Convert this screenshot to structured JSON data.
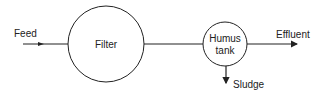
{
  "diagram": {
    "type": "process-flow",
    "nodes": [
      {
        "id": "filter",
        "label": "Filter",
        "shape": "circle"
      },
      {
        "id": "humus_tank",
        "label_line1": "Humus",
        "label_line2": "tank",
        "shape": "circle"
      }
    ],
    "streams": {
      "feed": "Feed",
      "effluent": "Effluent",
      "sludge": "Sludge"
    },
    "edges": [
      {
        "from": "Feed",
        "to": "filter"
      },
      {
        "from": "filter",
        "to": "humus_tank"
      },
      {
        "from": "humus_tank",
        "to": "Effluent"
      },
      {
        "from": "humus_tank",
        "to": "Sludge"
      }
    ],
    "colors": {
      "stroke": "#222222",
      "background": "#ffffff"
    }
  }
}
